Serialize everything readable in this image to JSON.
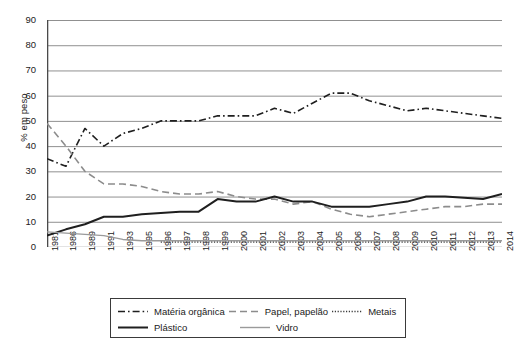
{
  "chart_data": {
    "type": "line",
    "title": "",
    "xlabel": "",
    "ylabel": "% em peso",
    "ylim": [
      0,
      90
    ],
    "ytick_step": 10,
    "grid": true,
    "legend_position": "bottom",
    "yticks": [
      "90",
      "80",
      "70",
      "60",
      "50",
      "40",
      "30",
      "20",
      "10",
      "0"
    ],
    "categories": [
      "1981",
      "1986",
      "1989",
      "1991",
      "1993",
      "1995",
      "1996",
      "1997",
      "1998",
      "1999",
      "2000",
      "2001",
      "2002",
      "2003",
      "2004",
      "2005",
      "2006",
      "2007",
      "2008",
      "2009",
      "2010",
      "2011",
      "2012",
      "2013",
      "2014"
    ],
    "series": [
      {
        "name": "Matéria orgânica",
        "style": "dash-dot",
        "color": "#1f1f1f",
        "width": 1.6,
        "values": [
          35,
          32,
          47,
          40,
          45,
          47,
          50,
          50,
          50,
          52,
          52,
          52,
          55,
          53,
          57,
          61,
          61,
          58,
          56,
          54,
          55,
          54,
          53,
          52,
          51
        ]
      },
      {
        "name": "Papel, papelão",
        "style": "dashed",
        "color": "#8c8c8c",
        "width": 1.6,
        "values": [
          49,
          40,
          30,
          25,
          25,
          24,
          22,
          21,
          21,
          22,
          20,
          19,
          19,
          17,
          18,
          15,
          13,
          12,
          13,
          14,
          15,
          16,
          16,
          17,
          17
        ]
      },
      {
        "name": "Metais",
        "style": "dotted",
        "color": "#3a3a3a",
        "width": 1.5,
        "values": [
          null,
          null,
          null,
          null,
          null,
          null,
          2,
          2,
          2,
          2,
          2,
          2,
          2,
          2,
          2,
          2,
          2,
          2,
          2,
          2,
          2,
          2,
          2,
          2,
          2
        ]
      },
      {
        "name": "Plástico",
        "style": "solid",
        "color": "#1f1f1f",
        "width": 2.0,
        "values": [
          4.5,
          7,
          9,
          12,
          12,
          13,
          13.5,
          14,
          14,
          19,
          18,
          18,
          20,
          18,
          18,
          16,
          16,
          16,
          17,
          18,
          20,
          20,
          19.5,
          19,
          21
        ]
      },
      {
        "name": "Vidro",
        "style": "solid",
        "color": "#9a9a9a",
        "width": 1.4,
        "values": [
          6,
          5.5,
          5,
          4.5,
          3,
          2.5,
          2.5,
          2.5,
          2.5,
          2.5,
          2.5,
          2.5,
          2.5,
          2.5,
          2.5,
          2.5,
          2.5,
          2.5,
          2.5,
          2.5,
          2.5,
          2.5,
          2.5,
          2.5,
          2.5
        ]
      }
    ]
  },
  "legend": {
    "rows": [
      [
        "Matéria orgânica",
        "Papel, papelão",
        "Metais"
      ],
      [
        "Plástico",
        "Vidro"
      ]
    ],
    "entries": [
      {
        "label": "Matéria orgânica"
      },
      {
        "label": "Papel, papelão"
      },
      {
        "label": "Metais"
      },
      {
        "label": "Plástico"
      },
      {
        "label": "Vidro"
      }
    ]
  },
  "axis": {
    "y_title": "% em peso",
    "axis_color": "#6e6e6e",
    "grid_color": "#909090"
  }
}
